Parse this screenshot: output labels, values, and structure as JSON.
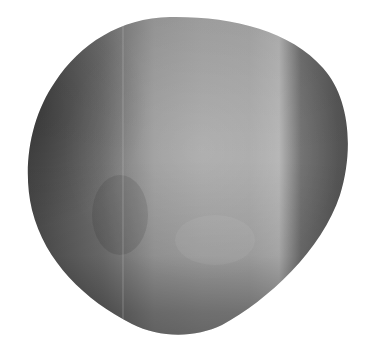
{
  "image": {
    "subject": "gray 3D rounded pebble shape",
    "background": "#ffffff",
    "colors": {
      "highlight": "#b4b4b4",
      "mid": "#8e8e8e",
      "shadow": "#4c4c4c",
      "deep_shadow": "#3e3e3e"
    }
  }
}
